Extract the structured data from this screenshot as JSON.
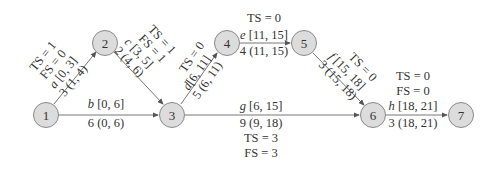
{
  "nodes": [
    {
      "id": "1",
      "label": "1",
      "x": 46,
      "y": 115
    },
    {
      "id": "2",
      "label": "2",
      "x": 105,
      "y": 43
    },
    {
      "id": "3",
      "label": "3",
      "x": 172,
      "y": 115
    },
    {
      "id": "4",
      "label": "4",
      "x": 227,
      "y": 43
    },
    {
      "id": "5",
      "label": "5",
      "x": 304,
      "y": 43
    },
    {
      "id": "6",
      "label": "6",
      "x": 373,
      "y": 115
    },
    {
      "id": "7",
      "label": "7",
      "x": 461,
      "y": 115
    }
  ],
  "edges": [
    {
      "from": "1",
      "to": "2",
      "name": "a",
      "es_ef": "[0, 3]",
      "duration_ls_lf": "3 (1, 4)",
      "ts": "TS = 1",
      "fs": "FS = 0"
    },
    {
      "from": "1",
      "to": "3",
      "name": "b",
      "es_ef": "[0, 6]",
      "duration_ls_lf": "6 (0, 6)"
    },
    {
      "from": "2",
      "to": "3",
      "name": "c",
      "es_ef": "[3, 5]",
      "duration_ls_lf": "2 (4, 6)",
      "ts": "TS = 1",
      "fs": "FS = 1"
    },
    {
      "from": "3",
      "to": "4",
      "name": "d",
      "es_ef": "[6, 11]",
      "duration_ls_lf": "5 (6, 11)",
      "ts": "TS = 0"
    },
    {
      "from": "4",
      "to": "5",
      "name": "e",
      "es_ef": "[11, 15]",
      "duration_ls_lf": "4 (11, 15)",
      "ts": "TS = 0"
    },
    {
      "from": "5",
      "to": "6",
      "name": "f",
      "es_ef": "[15, 18]",
      "duration_ls_lf": "3 (15, 18)",
      "ts": "TS = 0"
    },
    {
      "from": "3",
      "to": "6",
      "name": "g",
      "es_ef": "[6, 15]",
      "duration_ls_lf": "9 (9, 18)",
      "ts": "TS = 3",
      "fs": "FS = 3"
    },
    {
      "from": "6",
      "to": "7",
      "name": "h",
      "es_ef": "[18, 21]",
      "duration_ls_lf": "3 (18, 21)",
      "ts": "TS = 0",
      "fs": "FS = 0"
    }
  ]
}
